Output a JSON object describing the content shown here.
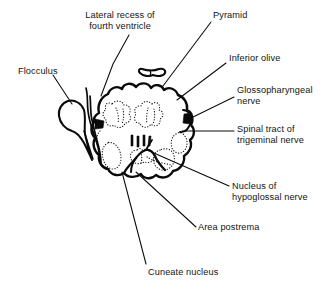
{
  "figure": {
    "background_color": "#ffffff",
    "ink_color": "#0a0a0a",
    "width": 336,
    "height": 291
  },
  "labels": [
    {
      "id": "lateral-recess",
      "text": "Lateral recess of\nfourth ventricle",
      "align": "center",
      "x": 68,
      "y": 10,
      "width": 104
    },
    {
      "id": "pyramid",
      "text": "Pyramid",
      "align": "left",
      "x": 213,
      "y": 10,
      "width": 60
    },
    {
      "id": "inferior-olive",
      "text": "Inferior olive",
      "align": "left",
      "x": 229,
      "y": 53,
      "width": 76
    },
    {
      "id": "flocculus",
      "text": "Flocculus",
      "align": "left",
      "x": 18,
      "y": 66,
      "width": 60
    },
    {
      "id": "glossopharyngeal-nerve",
      "text": "Glossopharyngeal\nnerve",
      "align": "left",
      "x": 237,
      "y": 85,
      "width": 96
    },
    {
      "id": "spinal-tract-trigeminal",
      "text": "Spinal tract of\ntrigeminal nerve",
      "align": "left",
      "x": 237,
      "y": 124,
      "width": 94
    },
    {
      "id": "nucleus-hypoglossal",
      "text": "Nucleus of\nhypoglossal nerve",
      "align": "left",
      "x": 232,
      "y": 181,
      "width": 100
    },
    {
      "id": "area-postrema",
      "text": "Area postrema",
      "align": "left",
      "x": 198,
      "y": 222,
      "width": 86
    },
    {
      "id": "cuneate-nucleus",
      "text": "Cuneate nucleus",
      "align": "left",
      "x": 148,
      "y": 267,
      "width": 96
    }
  ],
  "anatomy": {
    "medulla_outline": "M 98 114 C 96 106 100 98 107 94 C 110 88 117 86 122 89 C 125 84 132 83 136 87 C 140 83 147 83 150 88 C 154 84 161 85 163 90 C 168 87 175 89 177 95 C 183 97 187 103 186 110 C 190 113 192 119 190 125 C 193 129 193 136 189 140 C 191 146 188 153 183 156 C 184 163 179 170 172 171 C 169 177 161 179 156 175 C 151 179 144 178 141 173 C 136 177 129 177 125 173 C 119 176 112 174 109 168 C 103 167 99 161 100 155 C 95 151 93 144 96 138 C 92 134 91 127 95 122 C 94 119 95 116 98 114 Z",
    "pyramid_shape": "M 143 70 C 141 69 140 71 141 73 C 142 75 147 76 152 75 C 157 76 163 75 164 73 C 165 71 163 69 160 70 C 156 71 149 71 143 70 Z",
    "flocculus_shape": "M 66 102 C 61 104 58 110 59 117 C 60 124 65 130 72 131 C 78 132 83 128 85 122 C 87 115 85 107 80 103 C 76 100 70 100 66 102 Z",
    "structures": [
      {
        "name": "inferior-olive-left",
        "type": "dotted-nucleus"
      },
      {
        "name": "inferior-olive-right",
        "type": "dotted-nucleus"
      },
      {
        "name": "hypoglossal-nucleus",
        "type": "dotted-nucleus"
      },
      {
        "name": "cuneate-nucleus",
        "type": "dotted-nucleus"
      },
      {
        "name": "area-postrema",
        "type": "dotted-nucleus"
      },
      {
        "name": "spinal-tract-trigeminal",
        "type": "dotted-nucleus"
      },
      {
        "name": "glossopharyngeal-notch",
        "type": "solid-wedge"
      },
      {
        "name": "left-notch",
        "type": "solid-wedge"
      }
    ]
  }
}
